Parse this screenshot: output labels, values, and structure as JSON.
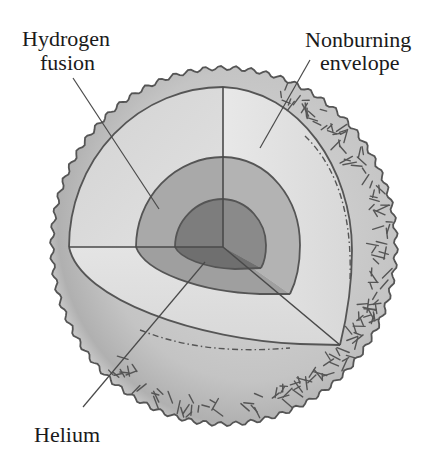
{
  "diagram": {
    "labels": {
      "hydrogen_fusion": {
        "line1": "Hydrogen",
        "line2": "fusion"
      },
      "nonburning_envelope": {
        "line1": "Nonburning",
        "line2": "envelope"
      },
      "helium": {
        "line1": "Helium"
      }
    },
    "regions": [
      {
        "name": "Helium core",
        "fill": "#7a7a7a"
      },
      {
        "name": "Hydrogen fusion shell",
        "fill": "#a8a8a8"
      },
      {
        "name": "Nonburning envelope (cut face)",
        "fill": "#d9d9d9"
      },
      {
        "name": "Outer surface",
        "fill": "#bdbdbd"
      }
    ],
    "colors": {
      "core": "#7a7a7a",
      "core_shadow": "#686868",
      "shell": "#a9a9a9",
      "shell_shadow": "#9a9a9a",
      "envelope_face": "#d6d6d6",
      "envelope_face_light": "#e6e6e6",
      "surface_light": "#d0d0d0",
      "surface_dark": "#a4a4a4",
      "outline": "#555555",
      "text": "#1a1a1a"
    }
  }
}
